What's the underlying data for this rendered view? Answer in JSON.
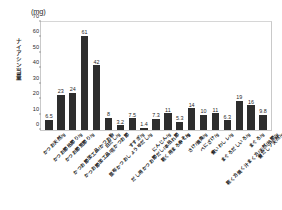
{
  "chart_data": {
    "type": "bar",
    "title": "",
    "unit_label": "(mg)",
    "ylabel": "ナイアシン当量",
    "xlabel": "",
    "ylim": [
      0,
      70
    ],
    "yticks": [
      0,
      10,
      20,
      30,
      40,
      50,
      60,
      70
    ],
    "grid": false,
    "legend": "none",
    "bar_color": "#2e2e2e",
    "categories": [
      "かつお天然/g",
      "かつお節枯節り/g",
      "かつお節荒節り/g",
      "かつお節加工品/かつお粉",
      "かつお節加工品/花かつお節",
      "白だし/g",
      "昆布かつおしょうゆだし/g",
      "すすぎ/g",
      "だし用かつお節だし/本枯れ節",
      "にんじん/g",
      "乾く用まろやく/g",
      "みそ/g",
      "さけ/焼魚/g",
      "べにざけ/g",
      "煮いわしレ/g",
      "まぐろだしいろ/g",
      "乾く方焼く汁まく方/天然/枯節/g",
      "まぐろ/g",
      "煮だしソ天然/g"
    ],
    "values": [
      6.5,
      23,
      24,
      61,
      42,
      8,
      3.2,
      7.5,
      1.4,
      7.3,
      11,
      5.3,
      14,
      10,
      11,
      6.3,
      19,
      16,
      9.8
    ],
    "value_labels": [
      "6.5",
      "23",
      "24",
      "61",
      "42",
      "8",
      "3.2",
      "7.5",
      "1.4",
      "7.3",
      "11",
      "5.3",
      "14",
      "10",
      "11",
      "6.3",
      "19",
      "16",
      "9.8"
    ]
  }
}
